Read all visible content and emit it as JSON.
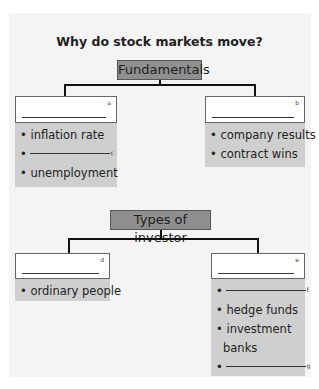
{
  "title": "Why do stock markets move?",
  "sections": [
    {
      "heading": "Fundamentals",
      "left": {
        "letter": "a",
        "items": [
          {
            "text": "inflation rate"
          },
          {
            "blank": true,
            "letter": "c"
          },
          {
            "text": "unemployment"
          }
        ]
      },
      "right": {
        "letter": "b",
        "items": [
          {
            "text": "company results"
          },
          {
            "text": "contract wins"
          }
        ]
      }
    },
    {
      "heading": "Types of investor",
      "left": {
        "letter": "d",
        "items": [
          {
            "text": "ordinary people"
          }
        ]
      },
      "right": {
        "letter": "e",
        "items": [
          {
            "blank": true,
            "letter": "f"
          },
          {
            "text": "hedge funds"
          },
          {
            "text": "investment"
          },
          {
            "text": "banks",
            "continuation": true
          },
          {
            "blank": true,
            "letter": "g"
          }
        ]
      }
    }
  ],
  "bullet": "•"
}
